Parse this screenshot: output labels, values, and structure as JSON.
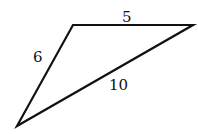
{
  "diagram": {
    "type": "triangle",
    "side_labels": {
      "top": "5",
      "left": "6",
      "hypotenuse": "10"
    },
    "colors": {
      "stroke": "#111111",
      "background": "#ffffff"
    }
  }
}
